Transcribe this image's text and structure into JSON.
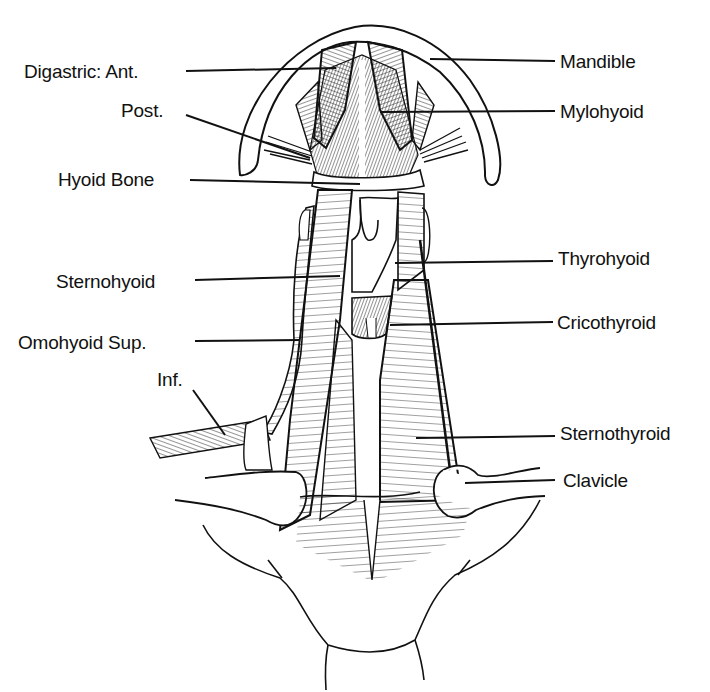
{
  "diagram": {
    "colors": {
      "ink": "#111111",
      "paper": "#ffffff"
    },
    "labels": [
      {
        "id": "digastric-ant",
        "text": "Digastric:  Ant.",
        "x": 24,
        "y": 62,
        "anchor": "left",
        "line": [
          186,
          71,
          336,
          68
        ]
      },
      {
        "id": "digastric-post",
        "text": "Post.",
        "x": 121,
        "y": 101,
        "anchor": "left",
        "line": [
          186,
          115,
          310,
          158
        ]
      },
      {
        "id": "hyoid-bone",
        "text": "Hyoid Bone",
        "x": 58,
        "y": 170,
        "anchor": "left",
        "line": [
          190,
          180,
          360,
          184
        ]
      },
      {
        "id": "sternohyoid",
        "text": "Sternohyoid",
        "x": 56,
        "y": 272,
        "anchor": "left",
        "line": [
          195,
          280,
          340,
          276
        ]
      },
      {
        "id": "omohyoid-sup",
        "text": "Omohyoid  Sup.",
        "x": 18,
        "y": 333,
        "anchor": "left",
        "line": [
          195,
          341,
          300,
          340
        ]
      },
      {
        "id": "omohyoid-inf",
        "text": "Inf.",
        "x": 157,
        "y": 370,
        "anchor": "left",
        "line": [
          193,
          390,
          225,
          435
        ]
      },
      {
        "id": "mandible",
        "text": "Mandible",
        "x": 560,
        "y": 52,
        "anchor": "left",
        "line": [
          430,
          59,
          555,
          61
        ]
      },
      {
        "id": "mylohyoid",
        "text": "Mylohyoid",
        "x": 560,
        "y": 102,
        "anchor": "left",
        "line": [
          380,
          112,
          555,
          111
        ]
      },
      {
        "id": "thyrohyoid",
        "text": "Thyrohyoid",
        "x": 558,
        "y": 249,
        "anchor": "left",
        "line": [
          395,
          263,
          553,
          261
        ]
      },
      {
        "id": "cricothyroid",
        "text": "Cricothyroid",
        "x": 557,
        "y": 313,
        "anchor": "left",
        "line": [
          390,
          325,
          553,
          322
        ]
      },
      {
        "id": "sternothyroid",
        "text": "Sternothyroid",
        "x": 560,
        "y": 424,
        "anchor": "left",
        "line": [
          416,
          438,
          555,
          436
        ]
      },
      {
        "id": "clavicle",
        "text": "Clavicle",
        "x": 563,
        "y": 471,
        "anchor": "left",
        "line": [
          465,
          483,
          555,
          480
        ]
      }
    ]
  }
}
